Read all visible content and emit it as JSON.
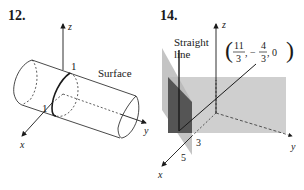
{
  "figures": [
    {
      "number": "12.",
      "axes": {
        "x": "x",
        "y": "y",
        "z": "z"
      },
      "labels": {
        "surface": "Surface",
        "radius_top": "1",
        "radius_left": "1"
      }
    },
    {
      "number": "14.",
      "axes": {
        "x": "x",
        "y": "y",
        "z": "z"
      },
      "labels": {
        "line_1": "Straight",
        "line_2": "line",
        "point_open": "(",
        "point_a_num": "11",
        "point_a_den": "3",
        "point_sep1": ", −",
        "point_b_num": "4",
        "point_b_den": "3",
        "point_c": ", 0",
        "point_close": ")",
        "tick_3": "3",
        "tick_5": "5"
      }
    }
  ],
  "colors": {
    "ink": "#1a1a1a",
    "plane_light": "#cfcfcf",
    "plane_mid": "#b5b5b5",
    "plane_dark": "#555555"
  }
}
